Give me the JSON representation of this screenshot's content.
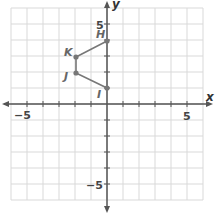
{
  "chart_data": {
    "type": "scatter",
    "title": "",
    "xlabel": "x",
    "ylabel": "y",
    "xlim": [
      -6,
      6
    ],
    "ylim": [
      -6,
      6
    ],
    "grid": true,
    "tick_labels": {
      "x": [
        "-5",
        "5"
      ],
      "y": [
        "5",
        "-5"
      ]
    },
    "points": [
      {
        "label": "H",
        "x": 0,
        "y": 4
      },
      {
        "label": "K",
        "x": -2,
        "y": 3
      },
      {
        "label": "J",
        "x": -2,
        "y": 2
      },
      {
        "label": "I",
        "x": 0,
        "y": 1
      }
    ],
    "segments": [
      [
        "H",
        "K"
      ],
      [
        "K",
        "J"
      ],
      [
        "J",
        "I"
      ]
    ],
    "colors": {
      "grid": "#d6d6d6",
      "axis": "#555555",
      "figure": "#777777"
    }
  },
  "labels": {
    "x_axis": "x",
    "y_axis": "y",
    "x_neg5": "−5",
    "x_pos5": "5",
    "y_pos5": "5",
    "y_neg5": "−5",
    "H": "H",
    "K": "K",
    "J": "J",
    "I": "I"
  }
}
